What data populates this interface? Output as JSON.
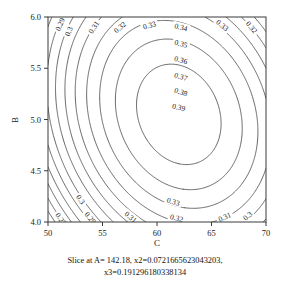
{
  "chart_data": {
    "type": "contour",
    "title": "",
    "xlabel": "C",
    "ylabel": "B",
    "xlim": [
      50,
      70
    ],
    "ylim": [
      4.0,
      6.0
    ],
    "xticks": [
      50,
      55,
      60,
      65,
      70
    ],
    "yticks": [
      4.0,
      4.5,
      5.0,
      5.5,
      6.0
    ],
    "xtick_labels": [
      "50",
      "55",
      "60",
      "65",
      "70"
    ],
    "ytick_labels": [
      "4.0",
      "4.5",
      "5.0",
      "5.5",
      "6.0"
    ],
    "grid": false,
    "legend": "none",
    "levels": [
      0.27,
      0.28,
      0.29,
      0.3,
      0.31,
      0.32,
      0.33,
      0.34,
      0.35,
      0.36,
      0.37,
      0.38,
      0.39
    ],
    "level_labels": [
      "0.27",
      "0.28",
      "0.29",
      "0.3",
      "0.31",
      "0.32",
      "0.33",
      "0.34",
      "0.35",
      "0.36",
      "0.37",
      "0.38",
      "0.39"
    ],
    "peak": {
      "x": 62.0,
      "y": 5.05,
      "value": 0.398
    },
    "surface_model": {
      "form": "z = zmax + a*(x-x0)^2 + b*(y-y0)^2 + c*(x-x0)*(y-y0)",
      "zmax": 0.398,
      "x0": 62.0,
      "y0": 5.05,
      "a": -0.00055,
      "b": -0.0345,
      "c": -0.0016
    },
    "labeled_contours": [
      {
        "label": "0.29",
        "x": 51.1,
        "y": 5.93
      },
      {
        "label": "0.3",
        "x": 51.9,
        "y": 5.86
      },
      {
        "label": "0.31",
        "x": 54.2,
        "y": 5.9
      },
      {
        "label": "0.32",
        "x": 56.6,
        "y": 5.9
      },
      {
        "label": "0.33",
        "x": 59.3,
        "y": 5.92
      },
      {
        "label": "0.34",
        "x": 62.2,
        "y": 5.9
      },
      {
        "label": "0.33",
        "x": 66.0,
        "y": 5.92
      },
      {
        "label": "0.32",
        "x": 68.7,
        "y": 5.9
      },
      {
        "label": "0.35",
        "x": 62.2,
        "y": 5.74
      },
      {
        "label": "0.36",
        "x": 62.2,
        "y": 5.58
      },
      {
        "label": "0.37",
        "x": 62.2,
        "y": 5.42
      },
      {
        "label": "0.38",
        "x": 62.2,
        "y": 5.27
      },
      {
        "label": "0.39",
        "x": 62.0,
        "y": 5.12
      },
      {
        "label": "0.3",
        "x": 53.0,
        "y": 4.22
      },
      {
        "label": "0.27",
        "x": 51.2,
        "y": 4.03
      },
      {
        "label": "0.29",
        "x": 53.9,
        "y": 4.04
      },
      {
        "label": "0.31",
        "x": 57.6,
        "y": 4.05
      },
      {
        "label": "0.33",
        "x": 61.5,
        "y": 4.2
      },
      {
        "label": "0.32",
        "x": 61.8,
        "y": 4.04
      },
      {
        "label": "0.31",
        "x": 66.2,
        "y": 4.05
      },
      {
        "label": "0.3",
        "x": 68.3,
        "y": 4.06
      }
    ]
  },
  "caption": {
    "line1": "Slice at A= 142.18, x2=0.0721665623043203,",
    "line2": "x3=0.191296180338134"
  },
  "colors": {
    "background": "#ffffff",
    "contour_line": "#4a4a4a",
    "axis": "#3a3a3a",
    "text": "#111111"
  }
}
